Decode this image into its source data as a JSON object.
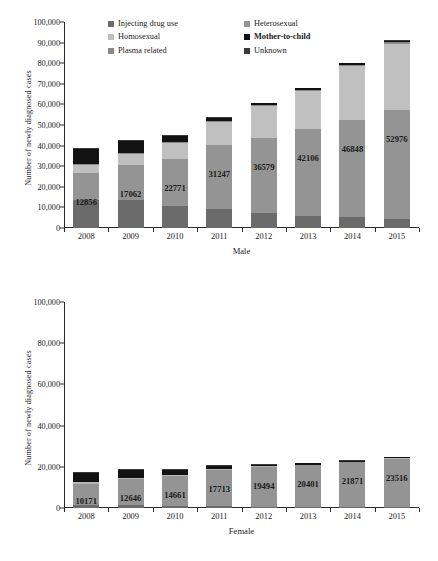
{
  "chart_data": [
    {
      "type": "bar",
      "stacked": true,
      "title": "",
      "xlabel": "Male",
      "ylabel": "Number of newly diagnosed cases",
      "categories": [
        "2008",
        "2009",
        "2010",
        "2011",
        "2012",
        "2013",
        "2014",
        "2015"
      ],
      "ylim": [
        0,
        100000
      ],
      "yticks": [
        "0",
        "10,000",
        "20,000",
        "30,000",
        "40,000",
        "50,000",
        "60,000",
        "70,000",
        "80,000",
        "90,000",
        "100,000"
      ],
      "grid": false,
      "legend_position": "top-center",
      "series": [
        {
          "name": "Injecting drug use",
          "color": "#6b6b6b",
          "values": [
            13800,
            13600,
            10900,
            9200,
            7200,
            5900,
            5400,
            4200
          ]
        },
        {
          "name": "Heterosexual",
          "color": "#949494",
          "values": [
            12856,
            17062,
            22771,
            31247,
            36579,
            42106,
            46848,
            52976
          ]
        },
        {
          "name": "Homosexual",
          "color": "#c0c0c0",
          "values": [
            3900,
            5500,
            7400,
            10900,
            15300,
            18600,
            26600,
            32400
          ]
        },
        {
          "name": "Plasma related",
          "color": "#8a8a8a",
          "values": [
            500,
            450,
            450,
            500,
            500,
            500,
            500,
            500
          ]
        },
        {
          "name": "Mother-to-child",
          "color": "#121212",
          "values": [
            7500,
            5800,
            3200,
            1600,
            900,
            700,
            600,
            600
          ]
        },
        {
          "name": "Unknown",
          "color": "#3a3a3a",
          "values": [
            450,
            450,
            400,
            400,
            400,
            400,
            400,
            400
          ]
        }
      ],
      "data_labels": [
        "12856",
        "17062",
        "22771",
        "31247",
        "36579",
        "42106",
        "46848",
        "52976"
      ],
      "totals": [
        39006,
        42862,
        45121,
        53847,
        60879,
        68206,
        80348,
        91076
      ]
    },
    {
      "type": "bar",
      "stacked": true,
      "title": "",
      "xlabel": "Female",
      "ylabel": "Number of newly diagnosed cases",
      "categories": [
        "2008",
        "2009",
        "2010",
        "2011",
        "2012",
        "2013",
        "2014",
        "2015"
      ],
      "ylim": [
        0,
        100000
      ],
      "yticks": [
        "0",
        "20,000",
        "40,000",
        "60,000",
        "80,000",
        "100,000"
      ],
      "grid": false,
      "legend_position": "top-center",
      "series": [
        {
          "name": "Injecting drug use",
          "color": "#6b6b6b",
          "values": [
            1400,
            1400,
            1000,
            800,
            500,
            400,
            300,
            300
          ]
        },
        {
          "name": "Heterosexual",
          "color": "#949494",
          "values": [
            10171,
            12646,
            14661,
            17713,
            19494,
            20401,
            21871,
            23516
          ]
        },
        {
          "name": "Plasma-related",
          "color": "#b5b5b5",
          "values": [
            900,
            700,
            500,
            400,
            300,
            300,
            300,
            300
          ]
        },
        {
          "name": "Mother-to-child",
          "color": "#121212",
          "values": [
            4400,
            3700,
            2200,
            1400,
            800,
            600,
            500,
            500
          ]
        },
        {
          "name": "Unknown",
          "color": "#3a3a3a",
          "values": [
            600,
            600,
            500,
            500,
            400,
            400,
            400,
            400
          ]
        }
      ],
      "data_labels": [
        "10171",
        "12646",
        "14661",
        "17713",
        "19494",
        "20401",
        "21871",
        "23516"
      ],
      "totals": [
        17471,
        19046,
        18861,
        20813,
        21494,
        22101,
        23371,
        25016
      ]
    }
  ],
  "male": {
    "ylabel": "Number of newly diagnosed cases",
    "xlabel": "Male",
    "yticks": [
      "100,000",
      "90,000",
      "80,000",
      "70,000",
      "60,000",
      "50,000",
      "40,000",
      "30,000",
      "20,000",
      "10,000",
      "0"
    ],
    "legend": [
      {
        "label": "Injecting drug use",
        "color": "#6b6b6b",
        "bold": false
      },
      {
        "label": "Heterosexual",
        "color": "#949494",
        "bold": false
      },
      {
        "label": "Homosexual",
        "color": "#c0c0c0",
        "bold": false
      },
      {
        "label": "Mother-to-child",
        "color": "#121212",
        "bold": true
      },
      {
        "label": "Plasma related",
        "color": "#8a8a8a",
        "bold": false
      },
      {
        "label": "Unknown",
        "color": "#3a3a3a",
        "bold": false
      }
    ]
  },
  "female": {
    "ylabel": "Number of newly diagnosed cases",
    "xlabel": "Female",
    "yticks": [
      "100,000",
      "80,000",
      "60,000",
      "40,000",
      "20,000",
      "0"
    ],
    "legend": [
      {
        "label": "Injecting drug use",
        "color": "#949494",
        "bold": false
      },
      {
        "label": "Heterosexual",
        "color": "#949494",
        "bold": false
      },
      {
        "label": "Mother-to-child",
        "color": "#121212",
        "bold": true
      },
      {
        "label": "Plasma-related",
        "color": "#b5b5b5",
        "bold": false
      },
      {
        "label": "Unknown",
        "color": "#1d1d1d",
        "bold": true
      }
    ]
  }
}
